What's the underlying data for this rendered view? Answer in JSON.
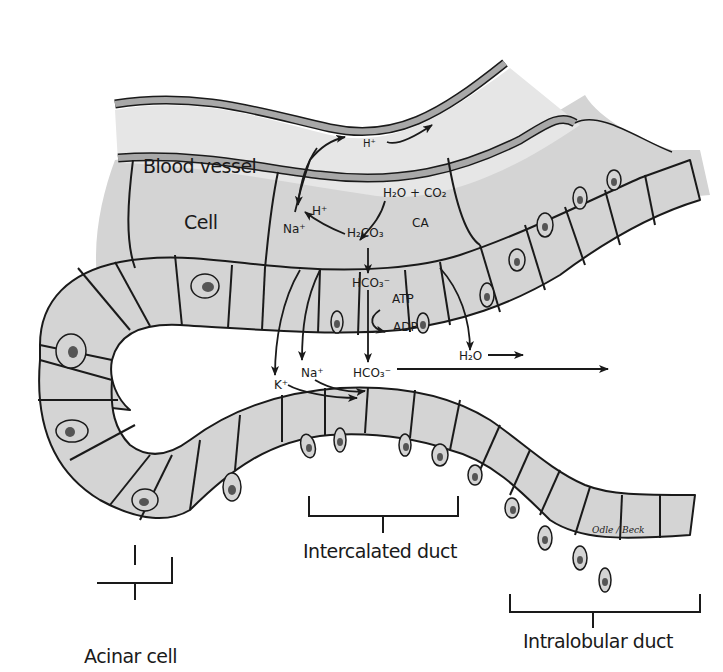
{
  "diagram": {
    "type": "anatomical illustration",
    "colors": {
      "cell_fill": "#d4d4d4",
      "vessel_fill": "#e6e6e6",
      "vessel_wall": "#a8a8a8",
      "outline": "#1a1a1a",
      "background": "#ffffff",
      "nucleus": "#555555"
    },
    "region_labels": {
      "blood_vessel": "Blood vessel",
      "cell": "Cell",
      "acinar_cell": "Acinar cell",
      "intercalated_duct": "Intercalated duct",
      "intralobular_duct": "Intralobular duct"
    },
    "chemistry": {
      "h_plus_vessel": "H⁺",
      "h_plus_cell": "H⁺",
      "na_plus_cell": "Na⁺",
      "h2o_co2": "H₂O + CO₂",
      "ca": "CA",
      "h2co3": "H₂CO₃",
      "hco3_cell": "HCO₃⁻",
      "atp": "ATP",
      "adp": "ADP",
      "k_plus_lumen": "K⁺",
      "na_plus_lumen": "Na⁺",
      "hco3_lumen": "HCO₃⁻",
      "h2o_lumen": "H₂O"
    },
    "signature": "Odle / Beck"
  }
}
